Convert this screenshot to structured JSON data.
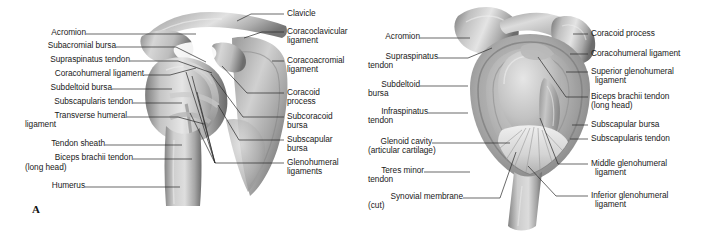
{
  "figure": {
    "background_color": "#ffffff",
    "line_color": "#2a2a2a",
    "text_color": "#1a1a1a",
    "panel_a_letter": "A"
  },
  "panel_a": {
    "name": "anterior-view-shoulder-joint",
    "left_labels": [
      {
        "text": "Acromion"
      },
      {
        "text": "Subacromial bursa"
      },
      {
        "text": "Supraspinatus tendon"
      },
      {
        "text": "Coracohumeral ligament"
      },
      {
        "text": "Subdeltoid bursa"
      },
      {
        "text": "Subscapularis tendon"
      },
      {
        "text": "Transverse humeral"
      },
      {
        "text": "ligament"
      },
      {
        "text": "Tendon sheath"
      },
      {
        "text": "Biceps brachii tendon"
      },
      {
        "text": "(long head)"
      },
      {
        "text": "Humerus"
      }
    ],
    "right_labels": [
      {
        "text": "Clavicle"
      },
      {
        "text": "Coracoclavicular"
      },
      {
        "text": "ligament"
      },
      {
        "text": "Coracoacromial"
      },
      {
        "text": "ligament"
      },
      {
        "text": "Coracoid"
      },
      {
        "text": "process"
      },
      {
        "text": "Subcoracoid"
      },
      {
        "text": "bursa"
      },
      {
        "text": "Subscapular"
      },
      {
        "text": "bursa"
      },
      {
        "text": "Glenohumeral"
      },
      {
        "text": "ligaments"
      }
    ]
  },
  "panel_b": {
    "name": "lateral-view-glenoid-cavity",
    "left_labels": [
      {
        "text": "Acromion"
      },
      {
        "text": "Supraspinatus"
      },
      {
        "text": "tendon"
      },
      {
        "text": "Subdeltoid"
      },
      {
        "text": "bursa"
      },
      {
        "text": "Infraspinatus"
      },
      {
        "text": "tendon"
      },
      {
        "text": "Glenoid cavity"
      },
      {
        "text": "(articular cartilage)"
      },
      {
        "text": "Teres minor"
      },
      {
        "text": "tendon"
      },
      {
        "text": "Synovial membrane"
      },
      {
        "text": "(cut)"
      }
    ],
    "right_labels": [
      {
        "text": "Coracoid process"
      },
      {
        "text": "Coracohumeral ligament"
      },
      {
        "text": "Superior glenohumeral"
      },
      {
        "text": "ligament"
      },
      {
        "text": "Biceps brachii tendon"
      },
      {
        "text": "(long head)"
      },
      {
        "text": "Subscapular bursa"
      },
      {
        "text": "Subscapularis tendon"
      },
      {
        "text": "Middle glenohumeral"
      },
      {
        "text": "ligament"
      },
      {
        "text": "Inferior glenohumeral"
      },
      {
        "text": "ligament"
      }
    ]
  }
}
